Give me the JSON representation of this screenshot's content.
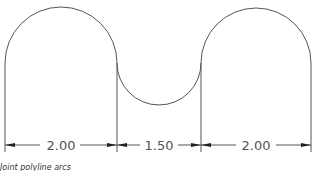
{
  "drawing": {
    "type": "cad-dimensioned-profile",
    "stroke_color": "#555555",
    "arrow_color": "#222222",
    "dimensions": [
      {
        "label": "2.00",
        "x1": 5,
        "x2": 117,
        "text_x": 61
      },
      {
        "label": "1.50",
        "x1": 117,
        "x2": 201,
        "text_x": 159
      },
      {
        "label": "2.00",
        "x1": 201,
        "x2": 311,
        "text_x": 256
      }
    ]
  },
  "caption": "Joint polyline arcs"
}
